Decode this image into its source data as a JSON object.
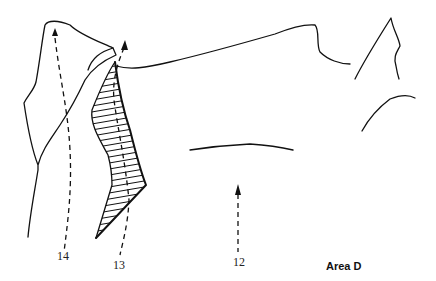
{
  "diagram": {
    "type": "climbing-topo",
    "title": "Area D",
    "routes": [
      {
        "number": "14"
      },
      {
        "number": "13"
      },
      {
        "number": "12"
      }
    ],
    "colors": {
      "ink": "#111111",
      "background": "#ffffff"
    }
  }
}
